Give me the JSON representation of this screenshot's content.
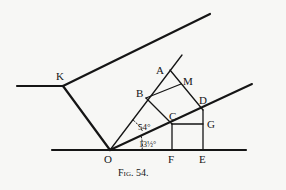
{
  "figure": {
    "caption": "Fig. 54.",
    "labels": {
      "K": "K",
      "A": "A",
      "M": "M",
      "B": "B",
      "D": "D",
      "C": "C",
      "G": "G",
      "O": "O",
      "F": "F",
      "E": "E"
    },
    "angles": {
      "upper": "54°",
      "lower": "13½°"
    },
    "colors": {
      "ink": "#151515",
      "paper": "#f7f7f5"
    }
  }
}
